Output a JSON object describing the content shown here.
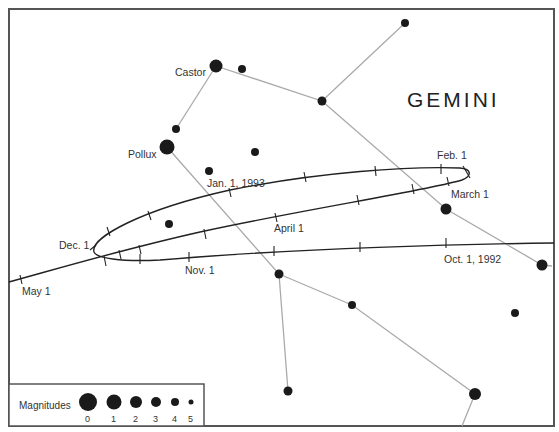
{
  "title": "GEMINI",
  "stars": {
    "castor": {
      "label": "Castor"
    },
    "pollux": {
      "label": "Pollux"
    }
  },
  "path_labels": {
    "jan": "Jan. 1, 1993",
    "feb": "Feb. 1",
    "march": "March 1",
    "april": "April 1",
    "may": "May 1",
    "dec": "Dec. 1",
    "nov": "Nov. 1",
    "oct": "Oct. 1, 1992"
  },
  "legend": {
    "title": "Magnitudes",
    "values": [
      "0",
      "1",
      "2",
      "3",
      "4",
      "5"
    ]
  },
  "colors": {
    "frame": "#555555",
    "star": "#1a1a1a",
    "constellation_line": "#aaaaaa",
    "path": "#222222"
  }
}
